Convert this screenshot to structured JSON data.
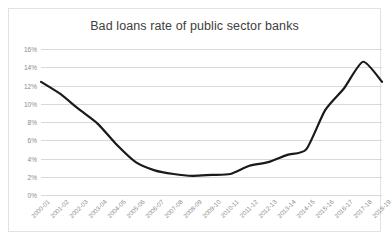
{
  "chart_data": {
    "type": "line",
    "title": "Bad loans rate of public sector banks",
    "xlabel": "",
    "ylabel": "",
    "categories": [
      "2000-01",
      "2001-02",
      "2002-03",
      "2003-04",
      "2004-05",
      "2005-06",
      "2006-07",
      "2007-08",
      "2008-09",
      "2009-10",
      "2010-11",
      "2011-12",
      "2012-13",
      "2013-14",
      "2014-15",
      "2015-16",
      "2016-17",
      "2017-18",
      "2018-19"
    ],
    "values": [
      12.4,
      11.1,
      9.4,
      7.8,
      5.5,
      3.6,
      2.7,
      2.3,
      2.1,
      2.2,
      2.3,
      3.2,
      3.6,
      4.4,
      5.0,
      9.3,
      11.7,
      14.6,
      12.4
    ],
    "series": [
      {
        "name": "Bad loans rate",
        "values": [
          12.4,
          11.1,
          9.4,
          7.8,
          5.5,
          3.6,
          2.7,
          2.3,
          2.1,
          2.2,
          2.3,
          3.2,
          3.6,
          4.4,
          5.0,
          9.3,
          11.7,
          14.6,
          12.4
        ],
        "color": "#1a1a1a"
      }
    ],
    "ylim": [
      0,
      16
    ],
    "yticks": [
      0,
      2,
      4,
      6,
      8,
      10,
      12,
      14,
      16
    ],
    "ytick_labels": [
      "0%",
      "2%",
      "4%",
      "6%",
      "8%",
      "10%",
      "12%",
      "14%",
      "16%"
    ],
    "grid": true,
    "grid_color": "#d9d9d9",
    "legend": false,
    "legend_position": "none",
    "units": "percent",
    "line_color": "#1a1a1a",
    "line_width": 2.2,
    "smoothing": true,
    "background": "#ffffff",
    "border_color": "#e2e2e2",
    "tick_label_color": "#8a8a8a",
    "title_color": "#404040",
    "xtick_rotation": -45
  }
}
